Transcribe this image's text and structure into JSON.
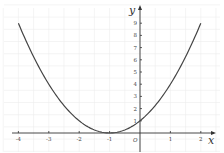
{
  "chart_data": {
    "type": "line",
    "title": "",
    "xlabel": "x",
    "ylabel": "y",
    "origin_label": "O",
    "function": "y = (x + 1)^2",
    "xlim": [
      -4,
      2
    ],
    "ylim": [
      0,
      9
    ],
    "grid": true,
    "x_ticks": [
      "-4",
      "-3",
      "-2",
      "-1",
      "1",
      "2"
    ],
    "y_ticks": [
      "1",
      "2",
      "3",
      "4",
      "5",
      "6",
      "7",
      "8",
      "9"
    ],
    "series": [
      {
        "name": "parabola",
        "x": [
          -4,
          -3.5,
          -3,
          -2.5,
          -2,
          -1.5,
          -1,
          -0.5,
          0,
          0.5,
          1,
          1.5,
          2
        ],
        "y": [
          9,
          6.25,
          4,
          2.25,
          1,
          0.25,
          0,
          0.25,
          1,
          2.25,
          4,
          6.25,
          9
        ]
      }
    ]
  }
}
